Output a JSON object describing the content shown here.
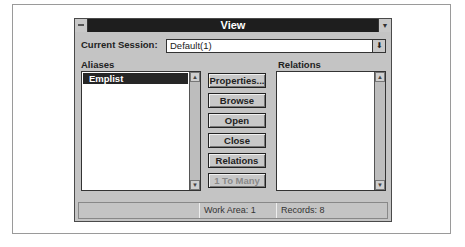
{
  "window": {
    "title": "View",
    "system_menu_icon": "minus-icon",
    "minimize_icon": "chevron-down-icon"
  },
  "session": {
    "label": "Current Session:",
    "value": "Default(1)",
    "dropdown_icon": "arrow-down-icon"
  },
  "aliases": {
    "label": "Aliases",
    "items": [
      "Emplist"
    ],
    "selected": "Emplist"
  },
  "relations": {
    "label": "Relations",
    "items": []
  },
  "buttons": [
    {
      "label": "Properties...",
      "enabled": true
    },
    {
      "label": "Browse",
      "enabled": true
    },
    {
      "label": "Open",
      "enabled": true
    },
    {
      "label": "Close",
      "enabled": true
    },
    {
      "label": "Relations",
      "enabled": true
    },
    {
      "label": "1 To Many",
      "enabled": false
    }
  ],
  "status_bar": {
    "cell1": "",
    "work_area": "Work Area: 1",
    "records": "Records: 8"
  }
}
